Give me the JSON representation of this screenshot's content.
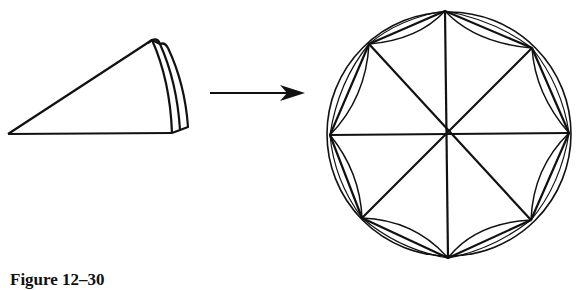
{
  "figure": {
    "caption": "Figure 12–30",
    "stroke_color": "#111111",
    "background": "#ffffff",
    "left_panel": {
      "description": "folded paper wedge (three layers)",
      "apex": [
        8,
        134
      ],
      "top_edge_end": [
        152,
        40
      ],
      "bottom_edge_end": [
        172,
        133
      ]
    },
    "arrow": {
      "from": [
        210,
        93
      ],
      "to": [
        305,
        93
      ],
      "direction": "right"
    },
    "right_panel": {
      "description": "unfolded circle with inscribed octagon, 8 radial spokes, and inward arcs",
      "center": [
        449,
        134
      ],
      "radius": 122,
      "octagon_vertices": 8
    }
  }
}
